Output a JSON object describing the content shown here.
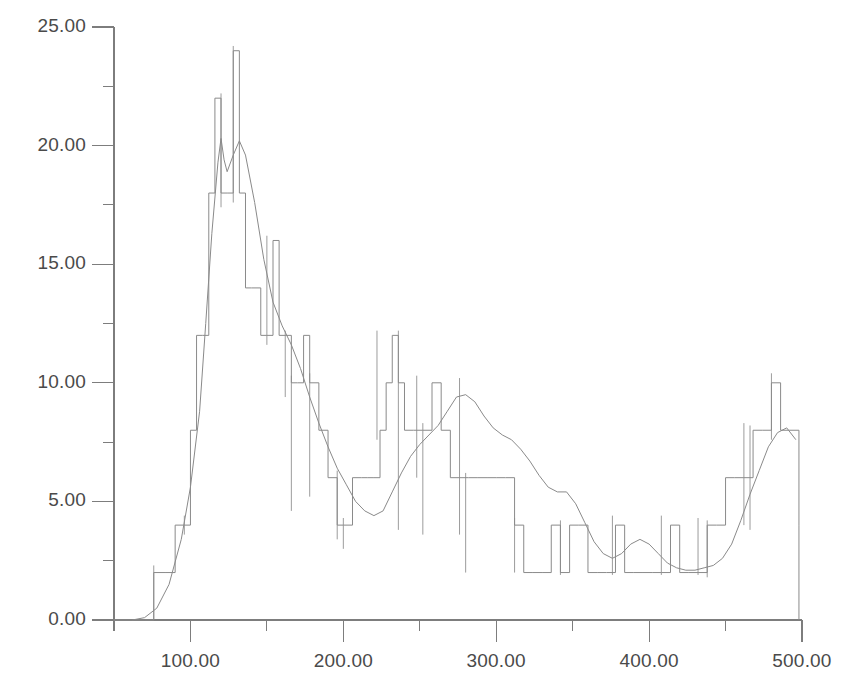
{
  "chart_data": {
    "type": "line",
    "title": "",
    "subtitle": "",
    "xlabel": "",
    "ylabel": "",
    "xlim": [
      50,
      500
    ],
    "ylim": [
      0,
      25
    ],
    "xticks": [
      100,
      200,
      300,
      400,
      500
    ],
    "xtick_labels": [
      "100.00",
      "200.00",
      "300.00",
      "400.00",
      "500.00"
    ],
    "yticks": [
      0,
      5,
      10,
      15,
      20,
      25
    ],
    "ytick_labels": [
      "0.00",
      "5.00",
      "10.00",
      "15.00",
      "20.00",
      "25.00"
    ],
    "x_minor_ticks": [
      50,
      150,
      250,
      350,
      450
    ],
    "y_minor_ticks": [
      2.5,
      7.5,
      12.5,
      17.5,
      22.5
    ],
    "grid": false,
    "legend": false,
    "legend_position": "none",
    "line_color": "#8a8a8a",
    "axis_color": "#7d7d7d",
    "background_color": "#ffffff",
    "series": [
      {
        "name": "step-histogram",
        "type": "step",
        "color": "#8a8a8a",
        "x": [
          50,
          70,
          76,
          84,
          90,
          96,
          100,
          104,
          108,
          112,
          116,
          120,
          124,
          128,
          132,
          136,
          140,
          146,
          150,
          154,
          158,
          162,
          166,
          170,
          174,
          178,
          184,
          190,
          196,
          200,
          206,
          212,
          216,
          220,
          224,
          228,
          232,
          236,
          240,
          246,
          252,
          258,
          264,
          270,
          276,
          282,
          288,
          294,
          300,
          306,
          312,
          318,
          324,
          330,
          336,
          342,
          348,
          354,
          360,
          366,
          372,
          378,
          384,
          390,
          396,
          402,
          408,
          414,
          420,
          426,
          432,
          438,
          444,
          450,
          456,
          462,
          468,
          474,
          480,
          486,
          492,
          498
        ],
        "values": [
          0,
          0,
          2,
          2,
          4,
          4,
          8,
          12,
          12,
          18,
          22,
          18,
          18,
          24,
          18,
          14,
          14,
          12,
          12,
          16,
          12,
          12,
          10,
          10,
          12,
          10,
          8,
          6,
          4,
          4,
          6,
          6,
          6,
          6,
          8,
          10,
          12,
          10,
          8,
          8,
          8,
          10,
          8,
          6,
          6,
          6,
          6,
          6,
          6,
          6,
          4,
          2,
          2,
          2,
          4,
          2,
          4,
          4,
          2,
          2,
          2,
          4,
          2,
          2,
          2,
          2,
          2,
          4,
          2,
          2,
          2,
          4,
          4,
          6,
          6,
          6,
          8,
          8,
          10,
          8,
          8,
          4
        ]
      },
      {
        "name": "smoothed-curve",
        "type": "line",
        "color": "#8a8a8a",
        "x": [
          62,
          70,
          78,
          86,
          94,
          100,
          106,
          110,
          114,
          118,
          120,
          122,
          124,
          128,
          132,
          136,
          142,
          148,
          154,
          160,
          166,
          172,
          178,
          184,
          190,
          196,
          202,
          208,
          214,
          220,
          226,
          232,
          238,
          244,
          250,
          256,
          262,
          268,
          274,
          280,
          286,
          292,
          298,
          304,
          310,
          316,
          322,
          328,
          334,
          340,
          346,
          352,
          358,
          364,
          370,
          376,
          382,
          388,
          394,
          400,
          406,
          412,
          418,
          424,
          430,
          436,
          442,
          448,
          454,
          460,
          466,
          472,
          478,
          484,
          490,
          496
        ],
        "values": [
          0.0,
          0.1,
          0.5,
          1.5,
          3.4,
          5.6,
          8.8,
          12.5,
          16.3,
          19.3,
          20.3,
          19.4,
          18.9,
          19.6,
          20.2,
          19.6,
          17.6,
          15.2,
          13.4,
          12.4,
          11.6,
          10.6,
          9.4,
          8.3,
          7.3,
          6.4,
          5.7,
          5.0,
          4.6,
          4.4,
          4.6,
          5.4,
          6.2,
          6.9,
          7.4,
          7.8,
          8.2,
          8.8,
          9.4,
          9.5,
          9.2,
          8.6,
          8.1,
          7.8,
          7.6,
          7.2,
          6.7,
          6.1,
          5.6,
          5.4,
          5.4,
          4.9,
          4.1,
          3.3,
          2.8,
          2.6,
          2.8,
          3.2,
          3.4,
          3.2,
          2.8,
          2.4,
          2.2,
          2.1,
          2.1,
          2.2,
          2.3,
          2.6,
          3.2,
          4.2,
          5.3,
          6.3,
          7.3,
          7.9,
          8.1,
          7.6
        ]
      }
    ]
  }
}
